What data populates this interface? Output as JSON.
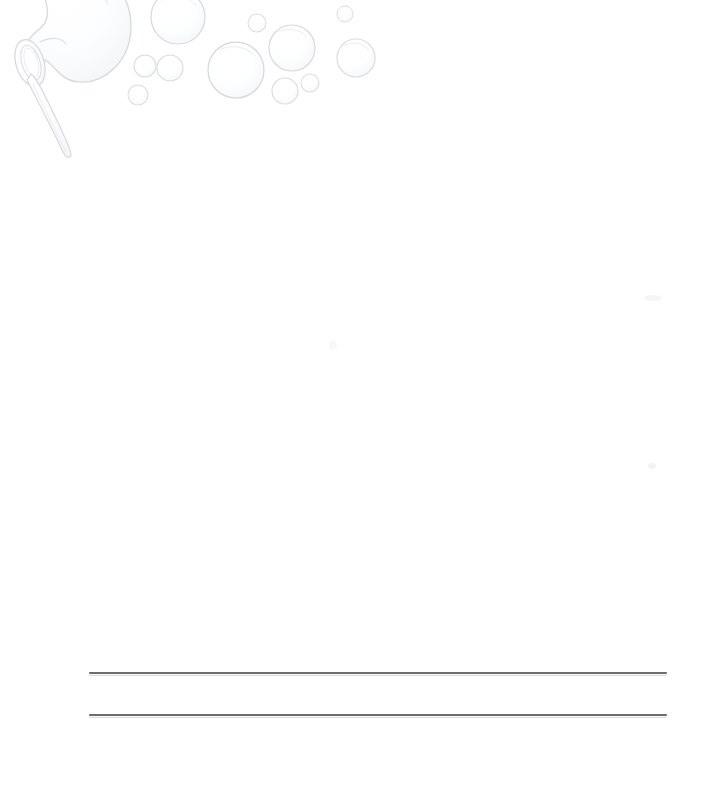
{
  "page": {
    "kind": "printed-stationery-sheet",
    "width": 706,
    "height": 790,
    "background_color": "#ffffff",
    "paper_tone": "#ffffff"
  },
  "artwork": {
    "name": "bubble-wand-illustration",
    "description": "Faint pale grey line drawing of a bubble wand blowing a large bubble, with a cluster of smaller bubbles drifting to the right",
    "stroke_color": "#d8dadd",
    "fill_color": "#fcfdfd",
    "position": {
      "x": 0,
      "y": 0,
      "width": 460,
      "height": 200
    },
    "wand": {
      "name": "bubble-wand",
      "ring": {
        "center_x": 30,
        "center_y": 63,
        "rx": 13,
        "ry": 23,
        "rotation_deg": -18,
        "inner_rx": 8,
        "inner_ry": 17
      },
      "handle": {
        "from_x": 34,
        "from_y": 82,
        "to_x": 66,
        "to_y": 156,
        "width": 6
      }
    },
    "forming_bubble": {
      "name": "forming-bubble",
      "center_x": 88,
      "center_y": 26,
      "radius": 42
    },
    "neck": {
      "name": "bubble-neck",
      "description": "Pinched connection between wand ring and forming bubble"
    },
    "bubbles": [
      {
        "name": "bubble-1",
        "cx": 178,
        "cy": 17,
        "r": 27
      },
      {
        "name": "bubble-2",
        "cx": 145,
        "cy": 66,
        "r": 11
      },
      {
        "name": "bubble-3",
        "cx": 170,
        "cy": 68,
        "r": 13
      },
      {
        "name": "bubble-4",
        "cx": 138,
        "cy": 95,
        "r": 10
      },
      {
        "name": "bubble-5",
        "cx": 257,
        "cy": 23,
        "r": 9
      },
      {
        "name": "bubble-6",
        "cx": 236,
        "cy": 70,
        "r": 28
      },
      {
        "name": "bubble-7",
        "cx": 292,
        "cy": 48,
        "r": 23
      },
      {
        "name": "bubble-8",
        "cx": 285,
        "cy": 91,
        "r": 13
      },
      {
        "name": "bubble-9",
        "cx": 310,
        "cy": 83,
        "r": 9
      },
      {
        "name": "bubble-10",
        "cx": 345,
        "cy": 14,
        "r": 8
      },
      {
        "name": "bubble-11",
        "cx": 356,
        "cy": 58,
        "r": 19
      }
    ]
  },
  "ruled_lines": {
    "name": "writing-lines",
    "color": "#3a3c3f",
    "thickness": 1.6,
    "left_x": 90,
    "right_x": 666,
    "lines": [
      {
        "name": "writing-line-1",
        "y": 673
      },
      {
        "name": "writing-line-2",
        "y": 715
      }
    ]
  },
  "specks": [
    {
      "name": "speck-1",
      "cx": 653,
      "cy": 298,
      "rx": 9,
      "ry": 3,
      "opacity": 0.1
    },
    {
      "name": "speck-2",
      "cx": 652,
      "cy": 466,
      "rx": 4,
      "ry": 3,
      "opacity": 0.12
    },
    {
      "name": "speck-3",
      "cx": 333,
      "cy": 345,
      "rx": 4,
      "ry": 5,
      "opacity": 0.07
    }
  ],
  "writing_area": {
    "name": "blank-writing-area",
    "label": "",
    "x": 90,
    "y": 200,
    "width": 576,
    "height": 440
  }
}
